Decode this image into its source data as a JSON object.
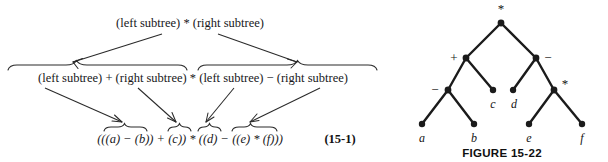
{
  "figure": {
    "equation_number": "(15-1)",
    "caption": "FIGURE 15-22",
    "ink_color": "#1a1a1a",
    "background_color": "#ffffff"
  },
  "derivation": {
    "rows": [
      {
        "id": "row-1",
        "label": "top-production",
        "text": "(left subtree) * (right subtree)",
        "tokens": [
          "(left subtree)",
          "*",
          "(right subtree)"
        ]
      },
      {
        "id": "row-2",
        "label": "expanded-production",
        "text": "(left subtree) + (right subtree) * (left subtree) − (right subtree)",
        "tokens": [
          "(left subtree)",
          "+",
          "(right subtree)",
          "*",
          "(left subtree)",
          "−",
          "(right subtree)"
        ]
      },
      {
        "id": "row-3",
        "label": "final-expression",
        "text": "(((a) − (b)) + (c)) * ((d) − ((e) * (f)))",
        "tokens": [
          "(((a)",
          "−",
          "(b))",
          "+",
          "(c))",
          "*",
          "((d)",
          "−",
          "((e)",
          "*",
          "(f)))"
        ]
      }
    ],
    "arrows": [
      {
        "name": "arrow-top-left",
        "from": "row-1 left subtree",
        "to": "row-2 left group"
      },
      {
        "name": "arrow-top-right",
        "from": "row-1 right subtree",
        "to": "row-2 right group"
      },
      {
        "name": "arrow-mid-1",
        "from": "row-2 left subtree",
        "to": "row-3 ((a) - (b))"
      },
      {
        "name": "arrow-mid-2",
        "from": "row-2 right subtree",
        "to": "row-3 (c)"
      },
      {
        "name": "arrow-mid-3",
        "from": "row-2 left subtree 2",
        "to": "row-3 (d)"
      },
      {
        "name": "arrow-mid-4",
        "from": "row-2 right subtree 2",
        "to": "row-3 ((e) * (f))"
      }
    ]
  },
  "tree": {
    "title": "expression-tree",
    "nodes": [
      {
        "id": "n-root",
        "label": "*",
        "kind": "operator",
        "x": 111,
        "y": 23
      },
      {
        "id": "n-plus",
        "label": "+",
        "kind": "operator",
        "x": 76,
        "y": 58
      },
      {
        "id": "n-minus",
        "label": "−",
        "kind": "operator",
        "x": 146,
        "y": 58
      },
      {
        "id": "n-sub",
        "label": "−",
        "kind": "operator",
        "x": 58,
        "y": 90
      },
      {
        "id": "n-mul2",
        "label": "*",
        "kind": "operator",
        "x": 164,
        "y": 90
      },
      {
        "id": "n-c",
        "label": "c",
        "kind": "leaf",
        "x": 103,
        "y": 90
      },
      {
        "id": "n-d",
        "label": "d",
        "kind": "leaf",
        "x": 123,
        "y": 90
      },
      {
        "id": "n-a",
        "label": "a",
        "kind": "leaf",
        "x": 32,
        "y": 124
      },
      {
        "id": "n-b",
        "label": "b",
        "kind": "leaf",
        "x": 84,
        "y": 124
      },
      {
        "id": "n-e",
        "label": "e",
        "kind": "leaf",
        "x": 139,
        "y": 124
      },
      {
        "id": "n-f",
        "label": "f",
        "kind": "leaf",
        "x": 192,
        "y": 124
      }
    ],
    "edges": [
      [
        "n-root",
        "n-plus"
      ],
      [
        "n-root",
        "n-minus"
      ],
      [
        "n-plus",
        "n-sub"
      ],
      [
        "n-plus",
        "n-c"
      ],
      [
        "n-minus",
        "n-d"
      ],
      [
        "n-minus",
        "n-mul2"
      ],
      [
        "n-sub",
        "n-a"
      ],
      [
        "n-sub",
        "n-b"
      ],
      [
        "n-mul2",
        "n-e"
      ],
      [
        "n-mul2",
        "n-f"
      ]
    ]
  }
}
